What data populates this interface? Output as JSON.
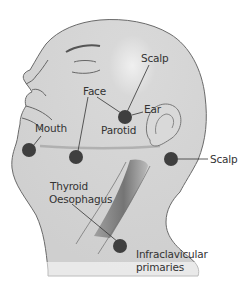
{
  "diagram": {
    "colors": {
      "skin": "#d4d4d4",
      "skin_outline": "#6a6a6a",
      "node": "#3f3f3f",
      "leader": "#333333",
      "text": "#333333",
      "tube_dark": "#6e6e6e",
      "tube_light": "#bdbdbd"
    },
    "nodes": [
      {
        "id": "parotid",
        "x": 125,
        "y": 117,
        "r": 7
      },
      {
        "id": "mouth",
        "x": 29,
        "y": 150,
        "r": 7
      },
      {
        "id": "face",
        "x": 76,
        "y": 157,
        "r": 7
      },
      {
        "id": "neck-scalp",
        "x": 171,
        "y": 159,
        "r": 7
      },
      {
        "id": "infraclavicular",
        "x": 120,
        "y": 246,
        "r": 7
      }
    ],
    "labels": {
      "scalp_top": "Scalp",
      "face": "Face",
      "ear": "Ear",
      "parotid": "Parotid",
      "mouth": "Mouth",
      "scalp_right": "Scalp",
      "thyroid": "Thyroid",
      "oesophagus": "Oesophagus",
      "infraclavicular_1": "Infraclavicular",
      "infraclavicular_2": "primaries"
    }
  }
}
